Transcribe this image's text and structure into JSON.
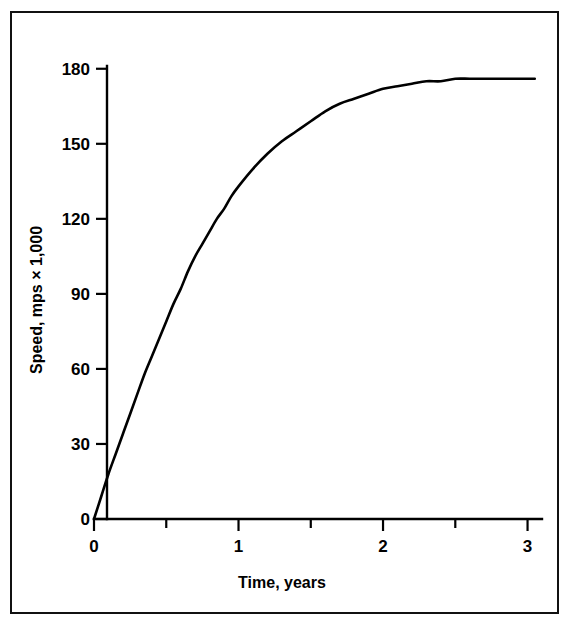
{
  "figure": {
    "border_color": "#111111",
    "background": "#ffffff"
  },
  "chart_data": {
    "type": "line",
    "title": "",
    "xlabel": "Time, years",
    "ylabel": "Speed, mps × 1,000",
    "xlim": [
      0,
      3.1
    ],
    "ylim": [
      0,
      185
    ],
    "grid": false,
    "legend": null,
    "line_color": "#000000",
    "x_ticks_major": [
      0,
      1,
      2,
      3
    ],
    "x_tick_labels": [
      "0",
      "1",
      "2",
      "3"
    ],
    "x_ticks_minor": [
      0.5,
      1.5,
      2.5
    ],
    "y_ticks_major": [
      0,
      30,
      60,
      90,
      120,
      150,
      180
    ],
    "y_tick_labels": [
      "0",
      "30",
      "60",
      "90",
      "120",
      "150",
      "180"
    ],
    "y_ticks_minor": [],
    "series": [
      {
        "name": "speed",
        "x": [
          0.0,
          0.05,
          0.1,
          0.15,
          0.2,
          0.25,
          0.3,
          0.35,
          0.4,
          0.45,
          0.5,
          0.55,
          0.6,
          0.65,
          0.7,
          0.75,
          0.8,
          0.85,
          0.9,
          0.95,
          1.0,
          1.1,
          1.2,
          1.3,
          1.4,
          1.5,
          1.6,
          1.7,
          1.8,
          1.9,
          2.0,
          2.1,
          2.2,
          2.3,
          2.4,
          2.5,
          2.6,
          2.7,
          2.8,
          2.9,
          3.0,
          3.05
        ],
        "y": [
          0,
          9,
          18,
          26,
          34,
          42,
          50,
          58,
          65,
          72,
          79,
          86,
          92,
          99,
          105,
          110,
          115,
          120,
          124,
          129,
          133,
          140,
          146,
          151,
          155,
          159,
          163,
          166,
          168,
          170,
          172,
          173,
          174,
          175,
          175,
          176,
          176,
          176,
          176,
          176,
          176,
          176
        ]
      }
    ]
  },
  "axes": {
    "y_label_text": "Speed, mps × 1,000",
    "x_label_text": "Time, years"
  }
}
